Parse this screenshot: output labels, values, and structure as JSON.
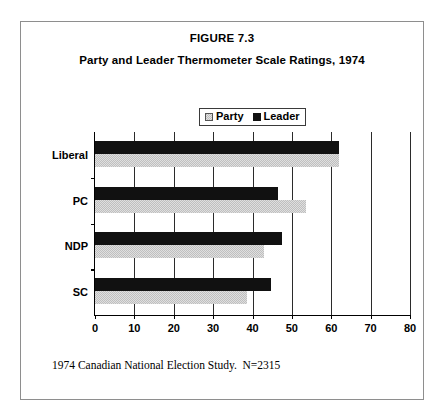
{
  "figure": {
    "title": "FIGURE 7.3",
    "subtitle": "Party and Leader Thermometer Scale Ratings, 1974",
    "footnote": "1974 Canadian National Election Study.  N=2315"
  },
  "legend": {
    "items": [
      {
        "label": "Party",
        "swatch": "party-swatch-icon",
        "color": "#BFBFBF"
      },
      {
        "label": "Leader",
        "swatch": "leader-swatch-icon",
        "color": "#111111"
      }
    ]
  },
  "axis": {
    "x_ticks": [
      "0",
      "10",
      "20",
      "30",
      "40",
      "50",
      "60",
      "70",
      "80"
    ],
    "y_categories": [
      "Liberal",
      "PC",
      "NDP",
      "SC"
    ]
  },
  "chart_data": {
    "type": "bar",
    "orientation": "horizontal",
    "title": "Party and Leader Thermometer Scale Ratings, 1974",
    "subtitle": "FIGURE 7.3",
    "xlabel": "",
    "ylabel": "",
    "xlim": [
      0,
      80
    ],
    "xticks": [
      0,
      10,
      20,
      30,
      40,
      50,
      60,
      70,
      80
    ],
    "grid": "vertical",
    "legend_position": "top-center",
    "categories": [
      "Liberal",
      "PC",
      "NDP",
      "SC"
    ],
    "series": [
      {
        "name": "Party",
        "color": "#BFBFBF",
        "values": [
          62.0,
          53.5,
          43.0,
          38.5
        ]
      },
      {
        "name": "Leader",
        "color": "#111111",
        "values": [
          62.0,
          46.5,
          47.5,
          44.8
        ]
      }
    ],
    "annotations": [
      "1974 Canadian National Election Study.  N=2315"
    ]
  }
}
